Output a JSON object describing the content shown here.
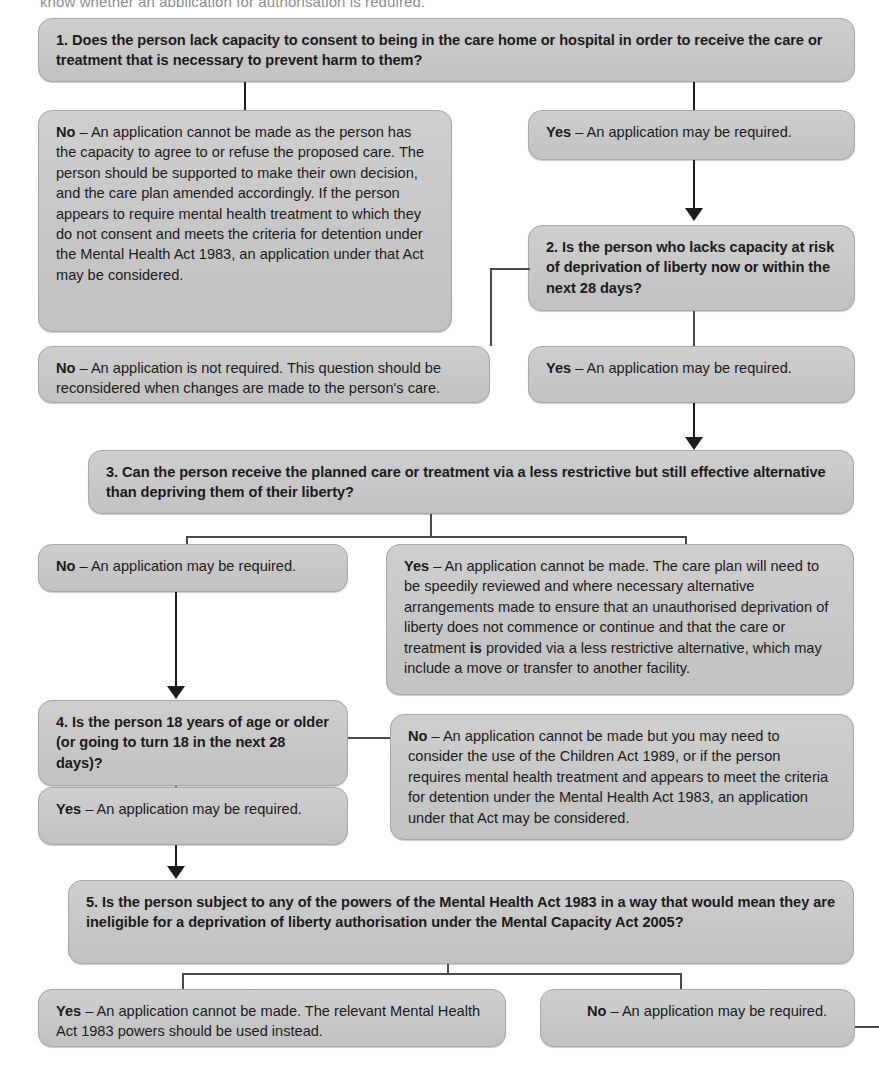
{
  "intro": {
    "cut_off_line": "know whether an application for authorisation is required."
  },
  "flowchart": {
    "title": "Deprivation of Liberty Safeguards decision flowchart",
    "colors": {
      "box_fill": "#c9c9c9",
      "box_border": "#a8a8a8",
      "connector": "#1c1c1c",
      "text": "#1b1b1b",
      "page_background": "#ffffff"
    },
    "nodes": {
      "q1": {
        "id": "1",
        "type": "question",
        "text": "1. Does the person lack capacity to consent to being in the care home or hospital in order to receive the care or treatment that is necessary to prevent harm to them?"
      },
      "q1_no": {
        "id": "q1-no",
        "type": "answer",
        "lead": "No",
        "dash": " – ",
        "text": "An application cannot be made as the person has the capacity to agree to or refuse the proposed care. The person should be supported to make their own decision, and the care plan amended accordingly. If the person appears to require mental health treatment to which they do not consent and meets the criteria for detention under the Mental Health Act 1983, an application under that Act may be considered."
      },
      "q1_yes": {
        "id": "q1-yes",
        "type": "answer",
        "lead": "Yes",
        "dash": " – ",
        "text": "An application may be required."
      },
      "q2": {
        "id": "2",
        "type": "question",
        "text": "2. Is the person who lacks capacity at risk of deprivation of liberty now or within the next 28 days?"
      },
      "q2_no": {
        "id": "q2-no",
        "type": "answer",
        "lead": "No",
        "dash": " – ",
        "text": "An application is not required. This question should be reconsidered when changes are made to the person's care."
      },
      "q2_yes": {
        "id": "q2-yes",
        "type": "answer",
        "lead": "Yes",
        "dash": " – ",
        "text": "An application may be required."
      },
      "q3": {
        "id": "3",
        "type": "question",
        "text": "3. Can the person receive the planned care or treatment via a less restrictive but still effective alternative than depriving them of their liberty?"
      },
      "q3_no": {
        "id": "q3-no",
        "type": "answer",
        "lead": "No",
        "dash": " – ",
        "text": "An application may be required."
      },
      "q3_yes": {
        "id": "q3-yes",
        "type": "answer",
        "lead": "Yes",
        "dash": " – ",
        "text_before_em": "An application cannot be made. The care plan will need to be speedily reviewed and where necessary alternative arrangements made to ensure that an unauthorised deprivation of liberty does not commence or continue and that the care or treatment ",
        "em": "is",
        "text_after_em": " provided via a less restrictive alternative, which may include a move or transfer to another facility."
      },
      "q4": {
        "id": "4",
        "type": "question",
        "text": "4. Is the person 18 years of age or older (or going to turn 18 in the next 28 days)?"
      },
      "q4_yes": {
        "id": "q4-yes",
        "type": "answer",
        "lead": "Yes",
        "dash": " – ",
        "text": "An application may be required."
      },
      "q4_no": {
        "id": "q4-no",
        "type": "answer",
        "lead": "No",
        "dash": " – ",
        "text": "An application cannot be made but you may need to consider the use of the Children Act 1989, or if the person requires mental health treatment and appears to meet the criteria for detention under the Mental Health Act 1983, an application under that Act may be considered."
      },
      "q5": {
        "id": "5",
        "type": "question",
        "text": "5. Is the person subject to any of the powers of the Mental Health Act 1983 in a way that would mean they are ineligible for a deprivation of liberty authorisation under the Mental Capacity Act 2005?"
      },
      "q5_yes": {
        "id": "q5-yes",
        "type": "answer",
        "lead": "Yes",
        "dash": " – ",
        "text": "An application cannot be made. The relevant Mental Health Act 1983 powers should be used instead."
      },
      "q5_no": {
        "id": "q5-no",
        "type": "answer",
        "lead": "No",
        "dash": " – ",
        "text": "An application may be required."
      }
    }
  }
}
